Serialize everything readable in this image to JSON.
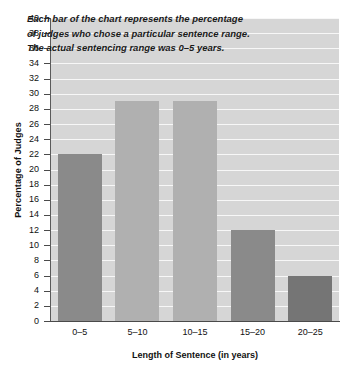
{
  "chart_data": {
    "type": "bar",
    "title": "",
    "xlabel": "Length of Sentence (in years)",
    "ylabel": "Percentage of Judges",
    "categories": [
      "0–5",
      "5–10",
      "10–15",
      "15–20",
      "20–25"
    ],
    "values": [
      22,
      29,
      29,
      12,
      6
    ],
    "ylim": [
      0,
      40
    ],
    "ytick_step": 2,
    "yticks": [
      0,
      2,
      4,
      6,
      8,
      10,
      12,
      14,
      16,
      18,
      20,
      22,
      24,
      26,
      28,
      30,
      32,
      34,
      36,
      38,
      40
    ],
    "ytick_labels": [
      "0",
      "2",
      "4",
      "6",
      "8",
      "10",
      "12",
      "14",
      "16",
      "18",
      "20",
      "22",
      "24",
      "26",
      "28",
      "30",
      "32",
      "34",
      "36",
      "38",
      "40"
    ],
    "grid": true,
    "grid_orientation": "horizontal",
    "grid_color": "#f7f7f7",
    "plot_background": "#d6d6d6",
    "legend": false,
    "bar_colors": [
      "#8a8a8a",
      "#b0b0b0",
      "#b0b0b0",
      "#8a8a8a",
      "#757575"
    ],
    "annotations": [
      "Each bar of the chart represents the percentage",
      "of judges who chose a particular sentence range.",
      "The actual sentencing range was 0–5 years."
    ]
  },
  "axes": {
    "y_title": "Percentage of Judges",
    "x_title": "Length of Sentence (in years)"
  }
}
